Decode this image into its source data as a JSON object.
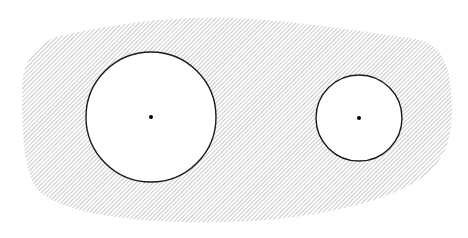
{
  "diagram": {
    "colors": {
      "background": "#ffffff",
      "hatch": "#8a8a8a",
      "outline": "#1a1a1a",
      "hole_fill": "#ffffff",
      "center_dot": "#000000"
    },
    "hatch": {
      "spacing": 3,
      "angle_deg": 45,
      "stroke_width": 0.9
    },
    "region": {
      "path": "M 60 36 C 120 22, 180 16, 230 18 C 290 20, 350 30, 410 38 C 440 42, 452 60, 452 110 C 452 160, 430 180, 380 198 C 320 218, 250 224, 180 222 C 120 220, 60 212, 38 190 C 22 172, 22 120, 22 90 C 22 60, 38 42, 60 36 Z"
    },
    "holes": [
      {
        "id": "large",
        "cx": 151,
        "cy": 117,
        "r": 65
      },
      {
        "id": "small",
        "cx": 359,
        "cy": 118,
        "r": 43
      }
    ],
    "center_dot_radius": 2
  }
}
